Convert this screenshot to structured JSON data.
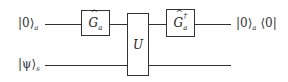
{
  "diagram": {
    "type": "quantum-circuit",
    "wires": [
      {
        "id": "ancilla",
        "input_label": "|0⟩",
        "input_sub": "a",
        "output_label": "|0⟩",
        "output_sub": "a",
        "output_tail": "⟨0|"
      },
      {
        "id": "system",
        "input_label": "|ψ⟩",
        "input_sub": "s"
      }
    ],
    "gates": [
      {
        "id": "G",
        "symbol": "G",
        "hat": "^",
        "sub": "a",
        "wires": [
          "ancilla"
        ]
      },
      {
        "id": "U",
        "symbol": "U",
        "wires": [
          "ancilla",
          "system"
        ]
      },
      {
        "id": "Gdag",
        "symbol": "G",
        "hat": "^",
        "sup": "†",
        "sub": "a",
        "wires": [
          "ancilla"
        ]
      }
    ]
  }
}
